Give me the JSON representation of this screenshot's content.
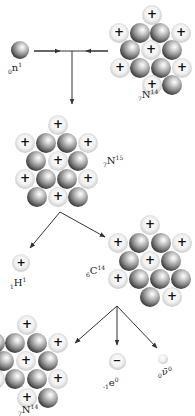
{
  "diagram": {
    "title": "Carbon-14 formation and beta decay",
    "colors": {
      "line": "#333333",
      "neutron_dark": "#1a1a1a",
      "proton_light": "#f2f2f2"
    },
    "ball_size": 20,
    "particles": {
      "neutron_in": {
        "label_pre": "0",
        "label_sym": "n",
        "label_sup": "1",
        "x": 20,
        "y": 50,
        "size": 18
      },
      "hydrogen": {
        "label_pre": "1",
        "label_sym": "H",
        "label_sup": "1",
        "x": 21,
        "y": 263,
        "size": 18
      },
      "electron": {
        "label_pre": "-1",
        "label_sym": "e",
        "label_sup": "0",
        "x": 117,
        "y": 361,
        "size": 17
      },
      "antineutrino": {
        "label_pre": "0",
        "label_sym": "ν̄",
        "label_sup": "0",
        "x": 163,
        "y": 359,
        "size": 10
      }
    },
    "nuclei": [
      {
        "id": "N14-top",
        "label_pre": "7",
        "label_sym": "N",
        "label_sup": "14",
        "label_x": 138,
        "label_y": 97,
        "balls": [
          {
            "x": 152,
            "y": 15,
            "t": "p"
          },
          {
            "x": 119,
            "y": 33,
            "t": "p"
          },
          {
            "x": 140,
            "y": 33,
            "t": "n"
          },
          {
            "x": 160,
            "y": 33,
            "t": "n"
          },
          {
            "x": 181,
            "y": 33,
            "t": "p"
          },
          {
            "x": 130,
            "y": 50,
            "t": "n"
          },
          {
            "x": 151,
            "y": 50,
            "t": "p"
          },
          {
            "x": 172,
            "y": 50,
            "t": "n"
          },
          {
            "x": 120,
            "y": 68,
            "t": "p"
          },
          {
            "x": 140,
            "y": 68,
            "t": "n"
          },
          {
            "x": 161,
            "y": 68,
            "t": "n"
          },
          {
            "x": 182,
            "y": 68,
            "t": "p"
          },
          {
            "x": 152,
            "y": 85,
            "t": "p"
          },
          {
            "x": 172,
            "y": 85,
            "t": "n"
          }
        ]
      },
      {
        "id": "N15",
        "label_pre": "7",
        "label_sym": "N",
        "label_sup": "15",
        "label_x": 103,
        "label_y": 163,
        "balls": [
          {
            "x": 58,
            "y": 125,
            "t": "p"
          },
          {
            "x": 25,
            "y": 143,
            "t": "p"
          },
          {
            "x": 46,
            "y": 143,
            "t": "n"
          },
          {
            "x": 67,
            "y": 143,
            "t": "n"
          },
          {
            "x": 88,
            "y": 143,
            "t": "p"
          },
          {
            "x": 36,
            "y": 161,
            "t": "n"
          },
          {
            "x": 58,
            "y": 161,
            "t": "p"
          },
          {
            "x": 78,
            "y": 161,
            "t": "n"
          },
          {
            "x": 25,
            "y": 179,
            "t": "p"
          },
          {
            "x": 46,
            "y": 179,
            "t": "n"
          },
          {
            "x": 67,
            "y": 179,
            "t": "n"
          },
          {
            "x": 88,
            "y": 179,
            "t": "p"
          },
          {
            "x": 37,
            "y": 197,
            "t": "n"
          },
          {
            "x": 58,
            "y": 197,
            "t": "p"
          },
          {
            "x": 78,
            "y": 197,
            "t": "n"
          }
        ]
      },
      {
        "id": "C14",
        "label_pre": "6",
        "label_sym": "C",
        "label_sup": "14",
        "label_x": 86,
        "label_y": 273,
        "balls": [
          {
            "x": 150,
            "y": 225,
            "t": "p"
          },
          {
            "x": 118,
            "y": 243,
            "t": "p"
          },
          {
            "x": 139,
            "y": 243,
            "t": "n"
          },
          {
            "x": 161,
            "y": 243,
            "t": "n"
          },
          {
            "x": 182,
            "y": 243,
            "t": "p"
          },
          {
            "x": 129,
            "y": 261,
            "t": "n"
          },
          {
            "x": 150,
            "y": 261,
            "t": "p"
          },
          {
            "x": 171,
            "y": 261,
            "t": "n"
          },
          {
            "x": 118,
            "y": 279,
            "t": "p"
          },
          {
            "x": 139,
            "y": 279,
            "t": "n"
          },
          {
            "x": 160,
            "y": 279,
            "t": "n"
          },
          {
            "x": 181,
            "y": 279,
            "t": "n"
          },
          {
            "x": 150,
            "y": 297,
            "t": "n"
          },
          {
            "x": 172,
            "y": 297,
            "t": "p"
          }
        ]
      },
      {
        "id": "N14-bottom",
        "label_pre": "7",
        "label_sym": "N",
        "label_sup": "14",
        "label_x": 18,
        "label_y": 412,
        "balls": [
          {
            "x": 27,
            "y": 325,
            "t": "p"
          },
          {
            "x": -5,
            "y": 343,
            "t": "n"
          },
          {
            "x": 15,
            "y": 343,
            "t": "n"
          },
          {
            "x": 37,
            "y": 343,
            "t": "n"
          },
          {
            "x": 58,
            "y": 343,
            "t": "p"
          },
          {
            "x": 4,
            "y": 361,
            "t": "n"
          },
          {
            "x": 26,
            "y": 361,
            "t": "p"
          },
          {
            "x": 48,
            "y": 361,
            "t": "n"
          },
          {
            "x": -5,
            "y": 379,
            "t": "p"
          },
          {
            "x": 15,
            "y": 379,
            "t": "n"
          },
          {
            "x": 37,
            "y": 379,
            "t": "n"
          },
          {
            "x": 58,
            "y": 379,
            "t": "p"
          },
          {
            "x": 27,
            "y": 398,
            "t": "p"
          },
          {
            "x": 48,
            "y": 398,
            "t": "n"
          }
        ]
      }
    ],
    "arrows": [
      {
        "id": "merge-line",
        "x1": 34,
        "y1": 51,
        "x2": 108,
        "y2": 51,
        "head": false
      },
      {
        "id": "neutron-arrow-head",
        "x1": 34,
        "y1": 51,
        "x2": 60,
        "y2": 51,
        "head": true
      },
      {
        "id": "nitrogen-arrow-head",
        "x1": 108,
        "y1": 51,
        "x2": 86,
        "y2": 51,
        "head": true
      },
      {
        "id": "to-n15",
        "x1": 72,
        "y1": 51,
        "x2": 72,
        "y2": 104,
        "head": true
      },
      {
        "id": "to-hydrogen",
        "x1": 60,
        "y1": 212,
        "x2": 30,
        "y2": 248,
        "head": true
      },
      {
        "id": "to-c14",
        "x1": 60,
        "y1": 212,
        "x2": 105,
        "y2": 237,
        "head": true
      },
      {
        "id": "to-n14",
        "x1": 117,
        "y1": 306,
        "x2": 75,
        "y2": 343,
        "head": true
      },
      {
        "id": "to-electron",
        "x1": 117,
        "y1": 306,
        "x2": 117,
        "y2": 345,
        "head": true
      },
      {
        "id": "to-antineutrino",
        "x1": 117,
        "y1": 306,
        "x2": 157,
        "y2": 348,
        "head": true
      }
    ],
    "label_positions": {
      "neutron_in": {
        "x": 8,
        "y": 62
      },
      "hydrogen": {
        "x": 10,
        "y": 277
      },
      "electron": {
        "x": 103,
        "y": 377
      },
      "antineutrino": {
        "x": 158,
        "y": 366
      }
    }
  }
}
